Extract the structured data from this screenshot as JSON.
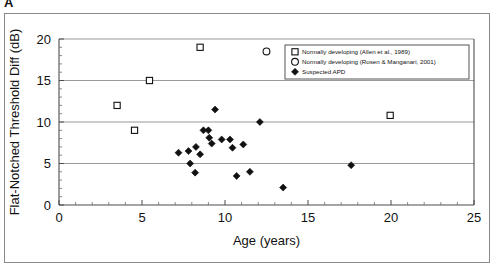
{
  "panel": {
    "label": "A"
  },
  "chart_data": {
    "type": "scatter",
    "title": "",
    "xlabel": "Age (years)",
    "ylabel": "Flat-Notched Threshold Diff (dB)",
    "xlim": [
      0,
      25
    ],
    "ylim": [
      0,
      20
    ],
    "xticks": [
      0,
      5,
      10,
      15,
      20,
      25
    ],
    "yticks": [
      0,
      5,
      10,
      15,
      20
    ],
    "xtick_labels": [
      "0",
      "5",
      "10",
      "15",
      "20",
      "25"
    ],
    "ytick_labels": [
      "0",
      "5",
      "10",
      "15",
      "20"
    ],
    "x_minor_tick_interval": 1,
    "y_minor_tick_interval": 1,
    "grid": "horizontal gridlines at y = 5, 10, 15, 20",
    "gridlines_y": [
      5,
      10,
      15,
      20
    ],
    "legend_position": "top-right inside plot area",
    "series": [
      {
        "name": "Normally developing (Allen et al., 1989)",
        "marker": "open-square",
        "color": "#ffffff",
        "edge_color": "#111111",
        "points": [
          {
            "x": 3.5,
            "y": 12.0
          },
          {
            "x": 4.55,
            "y": 9.0
          },
          {
            "x": 5.45,
            "y": 15.0
          },
          {
            "x": 8.5,
            "y": 19.0
          },
          {
            "x": 19.95,
            "y": 10.8
          }
        ]
      },
      {
        "name": "Normally developing (Rosen & Manganari, 2001)",
        "marker": "open-circle",
        "color": "#ffffff",
        "edge_color": "#111111",
        "points": [
          {
            "x": 12.5,
            "y": 18.5
          }
        ]
      },
      {
        "name": "Suspected APD",
        "marker": "filled-diamond",
        "color": "#111111",
        "edge_color": "#111111",
        "points": [
          {
            "x": 7.2,
            "y": 6.3
          },
          {
            "x": 7.8,
            "y": 6.5
          },
          {
            "x": 7.9,
            "y": 5.0
          },
          {
            "x": 8.2,
            "y": 3.9
          },
          {
            "x": 8.25,
            "y": 7.0
          },
          {
            "x": 8.5,
            "y": 6.1
          },
          {
            "x": 8.7,
            "y": 9.0
          },
          {
            "x": 9.0,
            "y": 9.0
          },
          {
            "x": 9.05,
            "y": 8.1
          },
          {
            "x": 9.2,
            "y": 7.4
          },
          {
            "x": 9.4,
            "y": 11.5
          },
          {
            "x": 9.8,
            "y": 7.9
          },
          {
            "x": 10.3,
            "y": 7.9
          },
          {
            "x": 10.45,
            "y": 6.9
          },
          {
            "x": 10.7,
            "y": 3.5
          },
          {
            "x": 11.1,
            "y": 7.3
          },
          {
            "x": 11.5,
            "y": 4.0
          },
          {
            "x": 12.1,
            "y": 10.0
          },
          {
            "x": 13.5,
            "y": 2.1
          },
          {
            "x": 17.6,
            "y": 4.8
          }
        ]
      }
    ]
  }
}
